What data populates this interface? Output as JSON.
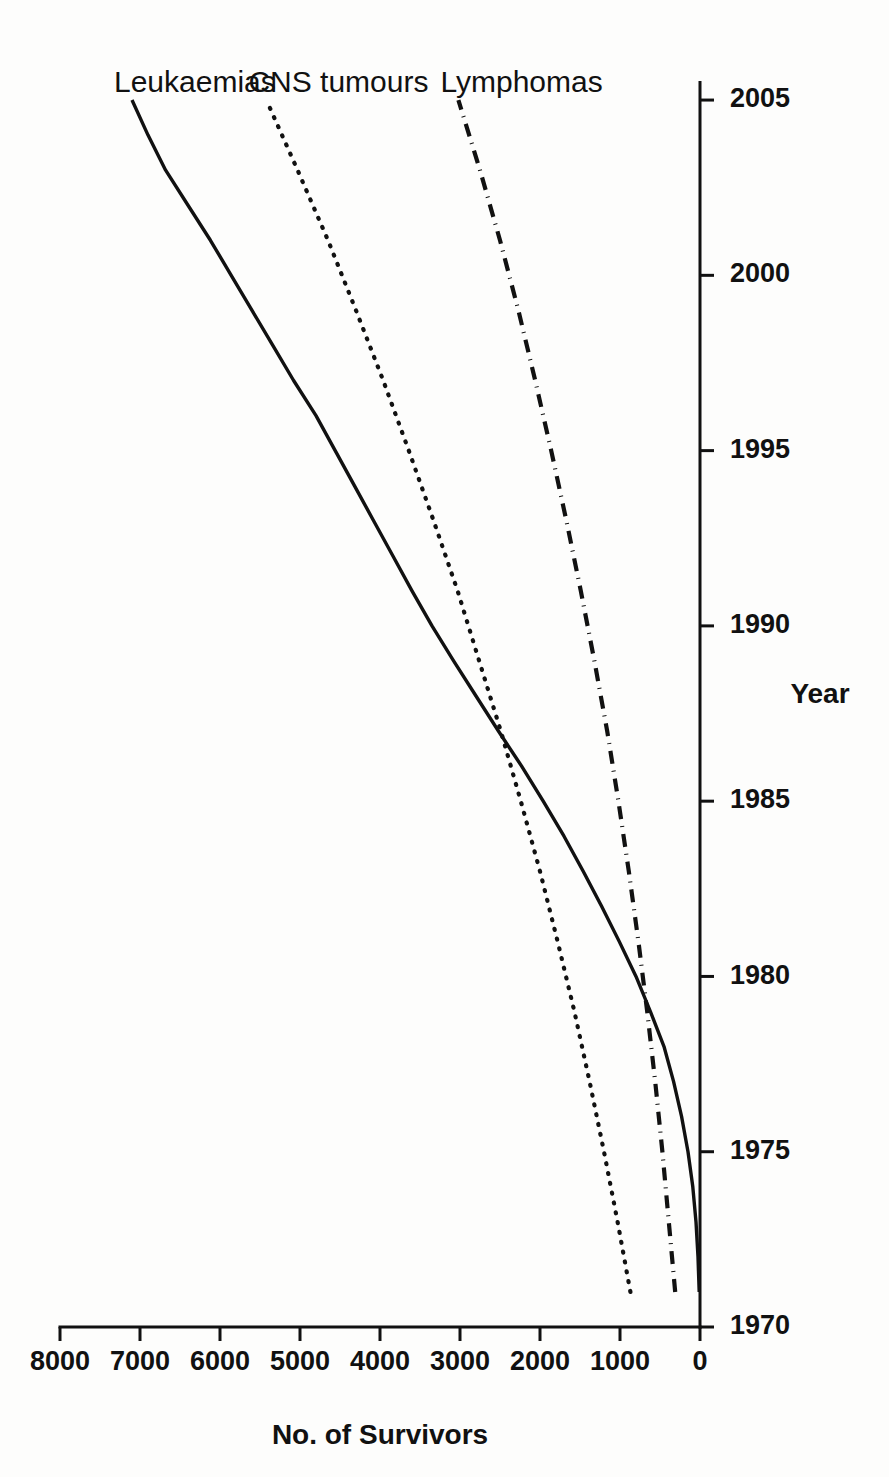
{
  "chart_data": {
    "type": "line",
    "title": "",
    "xlabel": "Year",
    "ylabel": "No. of Survivors",
    "xlim": [
      1970,
      2006
    ],
    "ylim": [
      0,
      8000
    ],
    "xticks": [
      "1970",
      "1975",
      "1980",
      "1985",
      "1990",
      "1995",
      "2000",
      "2005"
    ],
    "xtick_values": [
      1970,
      1975,
      1980,
      1985,
      1990,
      1995,
      2000,
      2005
    ],
    "yticks": [
      "0",
      "1000",
      "2000",
      "3000",
      "4000",
      "5000",
      "6000",
      "7000",
      "8000"
    ],
    "ytick_values": [
      0,
      1000,
      2000,
      3000,
      4000,
      5000,
      6000,
      7000,
      8000
    ],
    "grid": false,
    "legend_position": "inline-end-of-line",
    "series": [
      {
        "name": "Leukaemias",
        "style": "solid",
        "label_x": 2005,
        "label_y": 7100,
        "x": [
          1971,
          1972,
          1973,
          1974,
          1975,
          1976,
          1977,
          1978,
          1979,
          1980,
          1981,
          1982,
          1983,
          1984,
          1985,
          1986,
          1987,
          1988,
          1989,
          1990,
          1991,
          1992,
          1993,
          1994,
          1995,
          1996,
          1997,
          1998,
          1999,
          2000,
          2001,
          2002,
          2003,
          2004,
          2005
        ],
        "values": [
          10,
          25,
          50,
          90,
          150,
          230,
          330,
          450,
          620,
          800,
          1010,
          1230,
          1460,
          1700,
          1960,
          2230,
          2520,
          2800,
          3080,
          3350,
          3600,
          3840,
          4080,
          4320,
          4560,
          4800,
          5080,
          5340,
          5600,
          5860,
          6120,
          6400,
          6680,
          6900,
          7100
        ]
      },
      {
        "name": "CNS tumours",
        "style": "dotted",
        "label_x": 2005,
        "label_y": 5420,
        "x": [
          1971,
          1973,
          1975,
          1977,
          1979,
          1981,
          1983,
          1985,
          1987,
          1989,
          1991,
          1993,
          1995,
          1997,
          1999,
          2001,
          2003,
          2005
        ],
        "values": [
          870,
          1030,
          1200,
          1380,
          1570,
          1780,
          2000,
          2240,
          2490,
          2760,
          3030,
          3330,
          3640,
          3960,
          4300,
          4650,
          5030,
          5420
        ]
      },
      {
        "name": "Lymphomas",
        "style": "dashdot",
        "label_x": 2005,
        "label_y": 3020,
        "x": [
          1971,
          1973,
          1975,
          1977,
          1979,
          1981,
          1983,
          1985,
          1987,
          1989,
          1991,
          1993,
          1995,
          1997,
          1999,
          2001,
          2003,
          2005
        ],
        "values": [
          310,
          390,
          470,
          560,
          660,
          770,
          890,
          1020,
          1160,
          1320,
          1490,
          1670,
          1860,
          2060,
          2270,
          2500,
          2750,
          3020
        ]
      }
    ]
  },
  "axes": {
    "x_title": "Year",
    "y_title": "No. of Survivors"
  },
  "colors": {
    "ink": "#111111",
    "paper": "#fdfdfc"
  }
}
